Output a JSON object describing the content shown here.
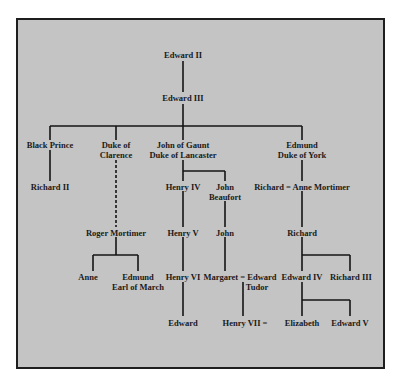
{
  "diagram": {
    "type": "family-tree",
    "background_color": "#c4c4c4",
    "line_color": "#151515",
    "nodes": [
      {
        "id": "edward2",
        "label": "Edward II"
      },
      {
        "id": "edward3",
        "label": "Edward III"
      },
      {
        "id": "black_prince",
        "label": "Black Prince"
      },
      {
        "id": "clarence",
        "label": "Duke of\nClarence",
        "line1": "Duke of",
        "line2": "Clarence"
      },
      {
        "id": "gaunt",
        "label": "John of Gaunt\nDuke of Lancaster",
        "line1": "John of Gaunt",
        "line2": "Duke of Lancaster"
      },
      {
        "id": "edmund_york",
        "label": "Edmund\nDuke of York",
        "line1": "Edmund",
        "line2": "Duke of York"
      },
      {
        "id": "richard2",
        "label": "Richard II"
      },
      {
        "id": "henry4",
        "label": "Henry IV"
      },
      {
        "id": "john_beaufort",
        "label": "John\nBeaufort",
        "line1": "John",
        "line2": "Beaufort"
      },
      {
        "id": "richard_anne",
        "label": "Richard = Anne Mortimer"
      },
      {
        "id": "roger_mortimer",
        "label": "Roger Mortimer"
      },
      {
        "id": "henry5",
        "label": "Henry V"
      },
      {
        "id": "john",
        "label": "John"
      },
      {
        "id": "richard",
        "label": "Richard"
      },
      {
        "id": "anne",
        "label": "Anne"
      },
      {
        "id": "edmund_march",
        "label": "Edmund\nEarl of March",
        "line1": "Edmund",
        "line2": "Earl of March"
      },
      {
        "id": "henry6",
        "label": "Henry VI"
      },
      {
        "id": "margaret_tudor",
        "label": "Margaret = Edward\nTudor",
        "line1": "Margaret = Edward",
        "line2": "Tudor"
      },
      {
        "id": "edward4",
        "label": "Edward IV"
      },
      {
        "id": "richard3",
        "label": "Richard III"
      },
      {
        "id": "edward",
        "label": "Edward"
      },
      {
        "id": "henry7",
        "label": "Henry VII ="
      },
      {
        "id": "elizabeth",
        "label": "Elizabeth"
      },
      {
        "id": "edward5",
        "label": "Edward V"
      }
    ],
    "edges": [
      {
        "from": "edward2",
        "to": "edward3",
        "style": "solid"
      },
      {
        "from": "edward3",
        "to": "black_prince",
        "style": "solid"
      },
      {
        "from": "edward3",
        "to": "clarence",
        "style": "solid"
      },
      {
        "from": "edward3",
        "to": "gaunt",
        "style": "solid"
      },
      {
        "from": "edward3",
        "to": "edmund_york",
        "style": "solid"
      },
      {
        "from": "black_prince",
        "to": "richard2",
        "style": "solid"
      },
      {
        "from": "clarence",
        "to": "roger_mortimer",
        "style": "dashed"
      },
      {
        "from": "gaunt",
        "to": "henry4",
        "style": "solid"
      },
      {
        "from": "gaunt",
        "to": "john_beaufort",
        "style": "solid"
      },
      {
        "from": "edmund_york",
        "to": "richard_anne",
        "style": "solid"
      },
      {
        "from": "roger_mortimer",
        "to": "anne",
        "style": "solid"
      },
      {
        "from": "roger_mortimer",
        "to": "edmund_march",
        "style": "solid"
      },
      {
        "from": "henry4",
        "to": "henry5",
        "style": "solid"
      },
      {
        "from": "john_beaufort",
        "to": "john",
        "style": "solid"
      },
      {
        "from": "richard_anne",
        "to": "richard",
        "style": "solid"
      },
      {
        "from": "henry5",
        "to": "henry6",
        "style": "solid"
      },
      {
        "from": "john",
        "to": "margaret_tudor",
        "style": "solid"
      },
      {
        "from": "richard",
        "to": "edward4",
        "style": "solid"
      },
      {
        "from": "richard",
        "to": "richard3",
        "style": "solid"
      },
      {
        "from": "henry6",
        "to": "edward",
        "style": "solid"
      },
      {
        "from": "margaret_tudor",
        "to": "henry7",
        "style": "solid"
      },
      {
        "from": "edward4",
        "to": "elizabeth",
        "style": "solid"
      },
      {
        "from": "edward4",
        "to": "edward5",
        "style": "solid"
      }
    ]
  }
}
